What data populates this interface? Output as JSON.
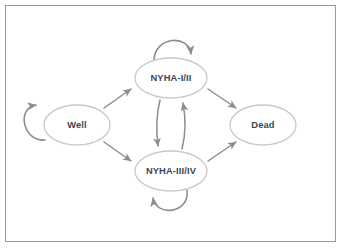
{
  "diagram": {
    "type": "state-transition-diagram",
    "frame": {
      "border_color": "#9a9a9a",
      "background": "#ffffff"
    },
    "style": {
      "node_stroke": "#c9c9c9",
      "node_fill": "#ffffff",
      "label_color": "#3c4652",
      "edge_color": "#8d8d8d"
    },
    "nodes": [
      {
        "id": "well",
        "label": "Well",
        "cx": 77,
        "cy": 125,
        "rx": 33,
        "ry": 20
      },
      {
        "id": "nyha12",
        "label": "NYHA-I/II",
        "cx": 171,
        "cy": 78,
        "rx": 36,
        "ry": 20
      },
      {
        "id": "nyha34",
        "label": "NYHA-III/IV",
        "cx": 171,
        "cy": 171,
        "rx": 36,
        "ry": 20
      },
      {
        "id": "dead",
        "label": "Dead",
        "cx": 263,
        "cy": 125,
        "rx": 33,
        "ry": 20
      }
    ],
    "edges": [
      {
        "id": "well-to-nyha12",
        "from": "well",
        "to": "nyha12",
        "shape": "diagonal-up-right"
      },
      {
        "id": "well-to-nyha34",
        "from": "well",
        "to": "nyha34",
        "shape": "diagonal-down-right"
      },
      {
        "id": "nyha12-to-dead",
        "from": "nyha12",
        "to": "dead",
        "shape": "diagonal-down-right"
      },
      {
        "id": "nyha34-to-dead",
        "from": "nyha34",
        "to": "dead",
        "shape": "diagonal-up-right"
      },
      {
        "id": "nyha12-to-nyha34",
        "from": "nyha12",
        "to": "nyha34",
        "shape": "vertical-down"
      },
      {
        "id": "nyha34-to-nyha12",
        "from": "nyha34",
        "to": "nyha12",
        "shape": "vertical-up"
      }
    ],
    "self_loops": [
      {
        "id": "well-self-loop",
        "node": "well",
        "position": "left"
      },
      {
        "id": "nyha12-self-loop",
        "node": "nyha12",
        "position": "top"
      },
      {
        "id": "nyha34-self-loop",
        "node": "nyha34",
        "position": "bottom"
      }
    ]
  }
}
